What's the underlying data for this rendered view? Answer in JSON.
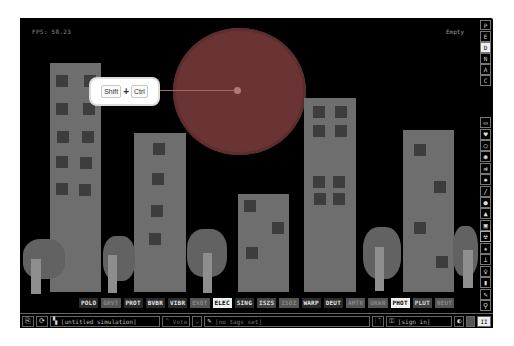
{
  "app": "The Powder Toy",
  "canvas": {
    "fps_label": "FPS: 58.23",
    "hover_label": "Empty",
    "background": "#000000"
  },
  "tooltip": {
    "keys": [
      "Shift",
      "Ctrl"
    ],
    "separator": "+"
  },
  "scene": {
    "moon_color": "#6b3434",
    "building_color": "#6e6e6e",
    "window_color": "#3d3d3d",
    "tree_color": "#626262",
    "trunk_color": "#8e8e8e"
  },
  "right_toolbar": {
    "display_modes": [
      {
        "label": "P",
        "active": false
      },
      {
        "label": "E",
        "active": false
      },
      {
        "label": "D",
        "active": true
      },
      {
        "label": "N",
        "active": false
      },
      {
        "label": "A",
        "active": false
      },
      {
        "label": "C",
        "active": false
      }
    ],
    "categories": [
      {
        "icon": "wall-icon"
      },
      {
        "icon": "electronics-icon"
      },
      {
        "icon": "powered-icon"
      },
      {
        "icon": "sensor-icon"
      },
      {
        "icon": "force-icon"
      },
      {
        "icon": "explosive-icon"
      },
      {
        "icon": "gas-icon"
      },
      {
        "icon": "liquid-icon"
      },
      {
        "icon": "powder-icon"
      },
      {
        "icon": "solid-icon"
      },
      {
        "icon": "radioactive-icon"
      },
      {
        "icon": "special-icon"
      },
      {
        "icon": "life-icon"
      },
      {
        "icon": "tools-icon"
      },
      {
        "icon": "favorites-icon"
      },
      {
        "icon": "decoration-icon"
      },
      {
        "icon": "search-icon"
      }
    ],
    "active_category": "radioactive-icon"
  },
  "element_bar": {
    "elements": [
      {
        "label": "POLO",
        "style": "normal"
      },
      {
        "label": "GRVT",
        "style": "dim"
      },
      {
        "label": "PROT",
        "style": "normal"
      },
      {
        "label": "BVBR",
        "style": "normal"
      },
      {
        "label": "VIBR",
        "style": "normal"
      },
      {
        "label": "EXOT",
        "style": "dim"
      },
      {
        "label": "ELEC",
        "style": "hi"
      },
      {
        "label": "SING",
        "style": "normal"
      },
      {
        "label": "ISZS",
        "style": "mid"
      },
      {
        "label": "ISOZ",
        "style": "dim"
      },
      {
        "label": "WARP",
        "style": "normal"
      },
      {
        "label": "DEUT",
        "style": "normal"
      },
      {
        "label": "AMTR",
        "style": "dim"
      },
      {
        "label": "URAN",
        "style": "dim"
      },
      {
        "label": "PHOT",
        "style": "hi"
      },
      {
        "label": "PLUT",
        "style": "mid"
      },
      {
        "label": "NEUT",
        "style": "dim"
      }
    ]
  },
  "status_bar": {
    "open_button": "open-icon",
    "reload_button": "reload-icon",
    "save_name": "[untitled simulation]",
    "vote_label": "Vote",
    "tags_label": "[no tags set]",
    "login_label": "[sign in]",
    "pause_label": "II"
  }
}
